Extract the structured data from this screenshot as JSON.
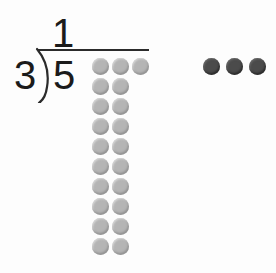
{
  "problem": {
    "type": "long-division",
    "quotient": "1",
    "divisor": "3",
    "dividend": "5",
    "bracket_icon": "division-bracket-icon"
  },
  "colors": {
    "background": "#fdfdfd",
    "ink": "#1b1b1b",
    "rule": "#2b2b2b",
    "counter_light": "#b5b5b5",
    "counter_dark": "#4b4b4b"
  },
  "counters": {
    "main_group": {
      "name": "dividend-counter-grid",
      "total": 21,
      "columns_max": 3,
      "rows": [
        {
          "count": 3,
          "shade": "light"
        },
        {
          "count": 2,
          "shade": "light"
        },
        {
          "count": 2,
          "shade": "light"
        },
        {
          "count": 2,
          "shade": "light"
        },
        {
          "count": 2,
          "shade": "light"
        },
        {
          "count": 2,
          "shade": "light"
        },
        {
          "count": 2,
          "shade": "light"
        },
        {
          "count": 2,
          "shade": "light"
        },
        {
          "count": 2,
          "shade": "light"
        },
        {
          "count": 2,
          "shade": "light"
        }
      ]
    },
    "side_group": {
      "name": "remainder-counter-group",
      "total": 3,
      "shade": "dark"
    }
  },
  "geometry": {
    "grid_left": 92,
    "grid_top": 58,
    "row_pitch": 20,
    "dot_size": 17
  }
}
